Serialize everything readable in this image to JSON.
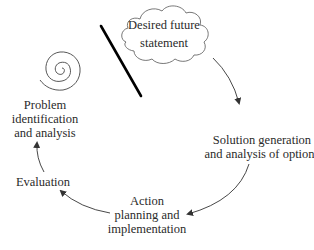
{
  "diagram": {
    "type": "cycle",
    "start": {
      "label_lines": [
        "Desired future",
        "statement"
      ],
      "shape": "cloud-icon"
    },
    "decorations": {
      "spiral": "spiral-icon",
      "barrier": "diagonal-line"
    },
    "nodes": [
      {
        "id": "solution",
        "label_lines": [
          "Solution generation",
          "and analysis of options"
        ]
      },
      {
        "id": "action",
        "label_lines": [
          "Action",
          "planning and",
          "implementation"
        ]
      },
      {
        "id": "evaluation",
        "label_lines": [
          "Evaluation"
        ]
      },
      {
        "id": "problem",
        "label_lines": [
          "Problem",
          "identification",
          "and analysis"
        ]
      }
    ],
    "edges": [
      {
        "from": "start",
        "to": "solution"
      },
      {
        "from": "solution",
        "to": "action"
      },
      {
        "from": "action",
        "to": "evaluation"
      },
      {
        "from": "evaluation",
        "to": "problem"
      }
    ],
    "colors": {
      "stroke": "#333333",
      "barrier": "#000000",
      "text": "#2a2a2a",
      "background": "#ffffff"
    }
  }
}
